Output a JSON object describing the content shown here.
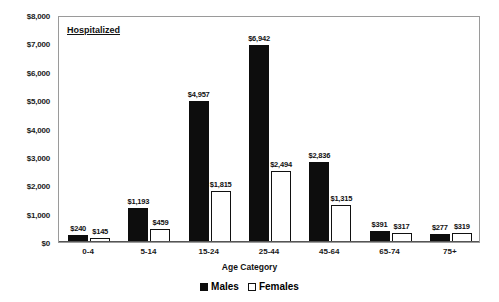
{
  "chart_data": {
    "type": "bar",
    "title": "Hospitalized",
    "xlabel": "Age Category",
    "ylabel": "",
    "ylim": [
      0,
      8000
    ],
    "ytick_labels": [
      "$0",
      "$1,000",
      "$2,000",
      "$3,000",
      "$4,000",
      "$5,000",
      "$6,000",
      "$7,000",
      "$8,000"
    ],
    "ytick_values": [
      0,
      1000,
      2000,
      3000,
      4000,
      5000,
      6000,
      7000,
      8000
    ],
    "grid": false,
    "legend_position": "bottom-center",
    "categories": [
      "0-4",
      "5-14",
      "15-24",
      "25-44",
      "45-64",
      "65-74",
      "75+"
    ],
    "series": [
      {
        "name": "Males",
        "color": "#0d0d0d",
        "values": [
          240,
          1193,
          4957,
          6942,
          2836,
          391,
          277
        ],
        "labels": [
          "$240",
          "$1,193",
          "$4,957",
          "$6,942",
          "$2,836",
          "$391",
          "$277"
        ]
      },
      {
        "name": "Females",
        "color": "#ffffff",
        "values": [
          145,
          459,
          1815,
          2494,
          1315,
          317,
          319
        ],
        "labels": [
          "$145",
          "$459",
          "$1,815",
          "$2,494",
          "$1,315",
          "$317",
          "$319"
        ]
      }
    ]
  },
  "legend": {
    "items": [
      {
        "label": "Males",
        "swatch": "filled-black-square"
      },
      {
        "label": "Females",
        "swatch": "open-white-square"
      }
    ]
  }
}
